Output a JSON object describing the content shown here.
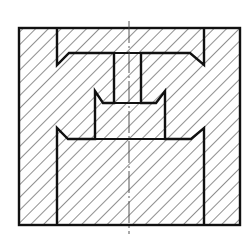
{
  "diagram": {
    "title": "Sectional view of stepped bore part",
    "type": "mechanical-section-drawing",
    "colors": {
      "background": "#ffffff",
      "outline": "#111111",
      "hatch": "#333333",
      "centerline": "#444444"
    },
    "outline_stroke": 2.4,
    "hatch_spacing": 9,
    "hatch_angle_deg": 45,
    "outer_boundary": {
      "x": 19,
      "y": 28,
      "width": 221,
      "height": 197
    },
    "centerline": {
      "x": 129,
      "y_start": 21,
      "y_end": 234,
      "dash": "22 3 2 3"
    },
    "features": [
      {
        "name": "top-slot",
        "x_left": 57,
        "x_right": 204,
        "y_top": 28,
        "y_bottom": 53,
        "chamfer_tip_y": 65
      },
      {
        "name": "center-bore",
        "x_left": 114,
        "x_right": 141,
        "y_top": 53,
        "y_bottom": 103
      },
      {
        "name": "middle-cavity",
        "x_left": 95,
        "x_right": 165,
        "y_top": 91,
        "y_bottom": 139,
        "chamfer_inner_y": 103
      },
      {
        "name": "bottom-cavity",
        "x_left": 57,
        "x_right": 204,
        "y_top": 139,
        "y_bottom": 225,
        "chamfer_tip_y": 128
      }
    ]
  }
}
